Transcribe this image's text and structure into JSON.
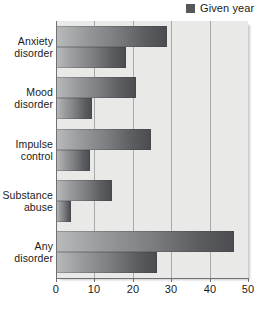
{
  "legend": {
    "entries": [
      {
        "label": "Given year",
        "color": "#55575a",
        "swatch_icon": "square-swatch-icon"
      }
    ]
  },
  "axis": {
    "x_ticks": [
      "0",
      "10",
      "20",
      "30",
      "40",
      "50"
    ],
    "x_tick_values": [
      0,
      10,
      20,
      30,
      40,
      50
    ]
  },
  "categories": [
    {
      "line1": "Anxiety",
      "line2": "disorder"
    },
    {
      "line1": "Mood",
      "line2": "disorder"
    },
    {
      "line1": "Impulse",
      "line2": "control"
    },
    {
      "line1": "Substance",
      "line2": "abuse"
    },
    {
      "line1": "Any",
      "line2": "disorder"
    }
  ],
  "chart_data": {
    "type": "bar",
    "orientation": "horizontal",
    "title": "",
    "subtitle": "",
    "xlabel": "",
    "ylabel": "",
    "xlim": [
      0,
      50
    ],
    "ylim": null,
    "grid": true,
    "legend_position": "top-right",
    "categories": [
      "Anxiety disorder",
      "Mood disorder",
      "Impulse control",
      "Substance abuse",
      "Any disorder"
    ],
    "series": [
      {
        "name": "Lifetime",
        "values": [
          28.8,
          20.8,
          24.8,
          14.6,
          46.4
        ]
      },
      {
        "name": "Given year",
        "values": [
          18.1,
          9.5,
          8.9,
          3.8,
          26.2
        ]
      }
    ],
    "xticks": [
      0,
      10,
      20,
      30,
      40,
      50
    ],
    "bar_gradient_from": "#b9babb",
    "bar_gradient_to": "#4a4c50",
    "plot_background": "#e9e9e7"
  }
}
